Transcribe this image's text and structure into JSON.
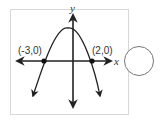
{
  "diagram": {
    "type": "parabola-graph",
    "axes": {
      "x_label": "x",
      "y_label": "y"
    },
    "points": [
      {
        "label": "(-3,0)",
        "x": -3,
        "y": 0
      },
      {
        "label": "(2,0)",
        "x": 2,
        "y": 0
      }
    ],
    "curve": {
      "shape": "downward-opening parabola",
      "roots": [
        -3,
        2
      ]
    },
    "colors": {
      "line": "#222222",
      "frame": "#d8d8d8",
      "circle": "#777777"
    }
  },
  "answer_choice": {
    "shape": "circle",
    "selected": false
  }
}
